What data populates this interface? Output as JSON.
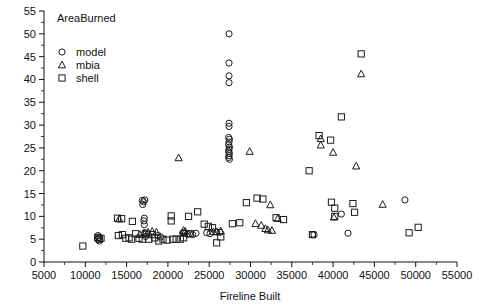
{
  "chart_data": {
    "type": "scatter",
    "title": "AreaBurned",
    "xlabel": "Fireline Built",
    "ylabel": "",
    "xlim": [
      5000,
      55000
    ],
    "ylim": [
      0,
      55
    ],
    "xticks": [
      5000,
      10000,
      15000,
      20000,
      25000,
      30000,
      35000,
      40000,
      45000,
      50000,
      55000
    ],
    "xtick_labels": [
      "5000",
      "10000",
      "15000",
      "20000",
      "25000",
      "30000",
      "35000",
      "40000",
      "45000",
      "50000",
      "55000"
    ],
    "yticks": [
      0,
      5,
      10,
      15,
      20,
      25,
      30,
      35,
      40,
      45,
      50,
      55
    ],
    "ytick_labels": [
      "0",
      "5",
      "10",
      "15",
      "20",
      "25",
      "30",
      "35",
      "40",
      "45",
      "50",
      "55"
    ],
    "minor_ticks": true,
    "grid": false,
    "legend_position": "top-left",
    "legend": [
      {
        "name": "model",
        "marker": "circle"
      },
      {
        "name": "mbia",
        "marker": "triangle"
      },
      {
        "name": "shell",
        "marker": "square"
      }
    ],
    "series": [
      {
        "name": "model",
        "marker": "circle",
        "points": [
          [
            11500,
            5.0
          ],
          [
            11600,
            5.4
          ],
          [
            11700,
            4.6
          ],
          [
            11550,
            5.8
          ],
          [
            16900,
            13.5
          ],
          [
            17050,
            13.2
          ],
          [
            17200,
            13.6
          ],
          [
            16950,
            12.6
          ],
          [
            17150,
            9.6
          ],
          [
            17100,
            9.0
          ],
          [
            17150,
            8.2
          ],
          [
            17200,
            6.4
          ],
          [
            17300,
            5.6
          ],
          [
            18800,
            5.8
          ],
          [
            19100,
            5.5
          ],
          [
            21800,
            6.4
          ],
          [
            21950,
            6.3
          ],
          [
            22350,
            6.1
          ],
          [
            22600,
            6.2
          ],
          [
            23000,
            6.0
          ],
          [
            23400,
            6.3
          ],
          [
            24700,
            6.4
          ],
          [
            25100,
            6.2
          ],
          [
            25900,
            6.6
          ],
          [
            26300,
            6.5
          ],
          [
            27400,
            50.0
          ],
          [
            27400,
            43.6
          ],
          [
            27400,
            40.8
          ],
          [
            27400,
            39.3
          ],
          [
            27400,
            30.4
          ],
          [
            27400,
            29.7
          ],
          [
            27350,
            27.3
          ],
          [
            27450,
            26.9
          ],
          [
            27400,
            26.3
          ],
          [
            27350,
            25.7
          ],
          [
            27450,
            25.2
          ],
          [
            27400,
            24.7
          ],
          [
            27350,
            24.2
          ],
          [
            27450,
            23.8
          ],
          [
            27400,
            23.3
          ],
          [
            27350,
            22.9
          ],
          [
            27450,
            22.5
          ],
          [
            37500,
            6.0
          ],
          [
            37700,
            6.0
          ],
          [
            41800,
            6.3
          ],
          [
            41000,
            10.5
          ],
          [
            48700,
            13.6
          ]
        ]
      },
      {
        "name": "mbia",
        "marker": "triangle",
        "points": [
          [
            14100,
            9.4
          ],
          [
            16600,
            6.0
          ],
          [
            17100,
            6.3
          ],
          [
            17600,
            6.5
          ],
          [
            18100,
            6.7
          ],
          [
            18600,
            6.5
          ],
          [
            21300,
            22.8
          ],
          [
            21900,
            6.9
          ],
          [
            22100,
            6.7
          ],
          [
            25500,
            6.6
          ],
          [
            25900,
            6.6
          ],
          [
            26400,
            6.8
          ],
          [
            29900,
            24.2
          ],
          [
            30600,
            8.4
          ],
          [
            31300,
            8.0
          ],
          [
            31800,
            7.3
          ],
          [
            32100,
            7.0
          ],
          [
            32600,
            6.9
          ],
          [
            33300,
            9.5
          ],
          [
            32400,
            12.5
          ],
          [
            38500,
            27.0
          ],
          [
            38500,
            25.6
          ],
          [
            40000,
            24.0
          ],
          [
            42800,
            21.0
          ],
          [
            40100,
            9.8
          ],
          [
            46000,
            12.6
          ],
          [
            43400,
            41.2
          ]
        ]
      },
      {
        "name": "shell",
        "marker": "square",
        "points": [
          [
            9700,
            3.5
          ],
          [
            11500,
            5.4
          ],
          [
            11700,
            5.0
          ],
          [
            11900,
            5.2
          ],
          [
            13900,
            9.6
          ],
          [
            14400,
            9.5
          ],
          [
            14000,
            5.8
          ],
          [
            14500,
            6.0
          ],
          [
            14900,
            5.2
          ],
          [
            15300,
            5.3
          ],
          [
            15700,
            8.9
          ],
          [
            15600,
            5.0
          ],
          [
            16100,
            6.2
          ],
          [
            16500,
            5.2
          ],
          [
            16900,
            5.0
          ],
          [
            17400,
            6.1
          ],
          [
            17700,
            5.0
          ],
          [
            18100,
            6.0
          ],
          [
            18400,
            5.3
          ],
          [
            18900,
            4.6
          ],
          [
            19400,
            5.0
          ],
          [
            19900,
            4.8
          ],
          [
            20400,
            10.1
          ],
          [
            20400,
            9.0
          ],
          [
            20600,
            5.0
          ],
          [
            21000,
            5.0
          ],
          [
            21500,
            5.0
          ],
          [
            21900,
            5.3
          ],
          [
            22500,
            10.0
          ],
          [
            22700,
            6.2
          ],
          [
            23600,
            11.0
          ],
          [
            24400,
            8.3
          ],
          [
            24900,
            7.8
          ],
          [
            25400,
            7.5
          ],
          [
            25900,
            4.2
          ],
          [
            26400,
            5.5
          ],
          [
            27800,
            8.4
          ],
          [
            28700,
            8.6
          ],
          [
            29500,
            13.0
          ],
          [
            30800,
            14.0
          ],
          [
            31500,
            13.8
          ],
          [
            33100,
            9.7
          ],
          [
            34000,
            9.3
          ],
          [
            37100,
            20.0
          ],
          [
            38300,
            27.7
          ],
          [
            39700,
            26.7
          ],
          [
            41000,
            31.8
          ],
          [
            43400,
            45.6
          ],
          [
            39800,
            13.1
          ],
          [
            40200,
            11.8
          ],
          [
            42400,
            12.8
          ],
          [
            42600,
            10.9
          ],
          [
            40200,
            10.0
          ],
          [
            49200,
            6.4
          ],
          [
            50300,
            7.6
          ],
          [
            37500,
            6.0
          ]
        ]
      }
    ]
  },
  "axes": {
    "x_axis_title": "Fireline Built",
    "y_axis_title": ""
  }
}
